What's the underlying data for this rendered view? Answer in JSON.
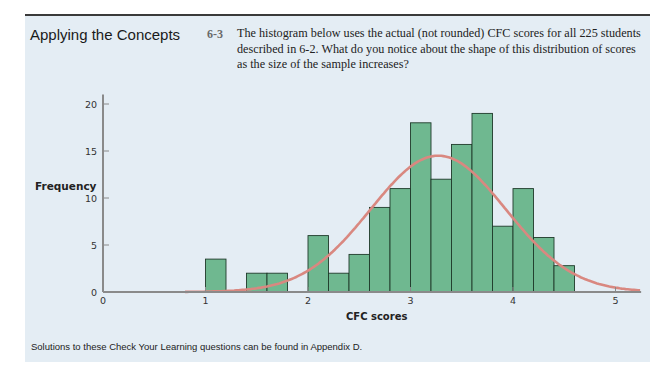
{
  "section": {
    "heading": "Applying the Concepts",
    "question_number": "6-3",
    "question_text": "The histogram below uses the actual (not rounded) CFC scores for all 225 students described in 6-2. What do you notice about the shape of this distribution of scores as the size of the sample increases?",
    "footer": "Solutions to these Check Your Learning questions can be found in Appendix D."
  },
  "colors": {
    "panel_bg": "#e4edf4",
    "bar_fill": "#6fb890",
    "bar_stroke": "#1f3a2a",
    "curve": "#d98880",
    "axis": "#8a8a8a"
  },
  "chart_data": {
    "type": "bar",
    "title": "",
    "xlabel": "CFC scores",
    "ylabel": "Frequency",
    "xlim": [
      0,
      5.25
    ],
    "ylim": [
      0,
      21
    ],
    "xticks": [
      0,
      1,
      2,
      3,
      4,
      5
    ],
    "yticks": [
      0,
      5,
      10,
      15,
      20
    ],
    "grid": false,
    "bin_width": 0.2,
    "bins": [
      {
        "start": 1.0,
        "end": 1.2,
        "count": 3.5
      },
      {
        "start": 1.2,
        "end": 1.4,
        "count": 0
      },
      {
        "start": 1.4,
        "end": 1.6,
        "count": 2
      },
      {
        "start": 1.6,
        "end": 1.8,
        "count": 2
      },
      {
        "start": 1.8,
        "end": 2.0,
        "count": 0
      },
      {
        "start": 2.0,
        "end": 2.2,
        "count": 6
      },
      {
        "start": 2.2,
        "end": 2.4,
        "count": 2
      },
      {
        "start": 2.4,
        "end": 2.6,
        "count": 4
      },
      {
        "start": 2.6,
        "end": 2.8,
        "count": 9
      },
      {
        "start": 2.8,
        "end": 3.0,
        "count": 11
      },
      {
        "start": 3.0,
        "end": 3.2,
        "count": 18
      },
      {
        "start": 3.2,
        "end": 3.4,
        "count": 12
      },
      {
        "start": 3.4,
        "end": 3.6,
        "count": 15.7
      },
      {
        "start": 3.6,
        "end": 3.8,
        "count": 19
      },
      {
        "start": 3.8,
        "end": 4.0,
        "count": 7
      },
      {
        "start": 4.0,
        "end": 4.2,
        "count": 11
      },
      {
        "start": 4.2,
        "end": 4.4,
        "count": 5.8
      },
      {
        "start": 4.4,
        "end": 4.6,
        "count": 2.8
      }
    ],
    "overlay": {
      "type": "normal_curve",
      "mean": 3.27,
      "peak": 14.5,
      "sd": 0.66,
      "x_range": [
        0.8,
        5.25
      ]
    }
  }
}
